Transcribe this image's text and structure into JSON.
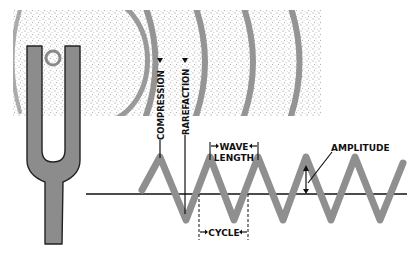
{
  "diagram": {
    "labels": {
      "compression": "COMPRESSION",
      "rarefaction": "RAREFACTION",
      "wave_length_line1": "WAVE",
      "wave_length_line2": "LENGTH",
      "cycle": "CYCLE",
      "amplitude": "AMPLITUDE"
    },
    "colors": {
      "wave": "#8f8f8f",
      "fork_fill": "#8c8c8c",
      "fork_stroke": "#222222",
      "compression_band": "#8a8a8a",
      "dots": "#a9a9a9",
      "line": "#111111"
    }
  }
}
